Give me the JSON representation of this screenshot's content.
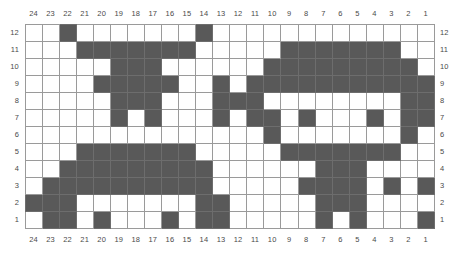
{
  "chart_data": {
    "type": "heatmap",
    "title": "",
    "xlabel": "",
    "ylabel": "",
    "columns": 24,
    "rows": 12,
    "column_labels_top": [
      "24",
      "23",
      "22",
      "21",
      "20",
      "19",
      "18",
      "17",
      "16",
      "15",
      "14",
      "13",
      "12",
      "11",
      "10",
      "9",
      "8",
      "7",
      "6",
      "5",
      "4",
      "3",
      "2",
      "1"
    ],
    "column_labels_bottom": [
      "24",
      "23",
      "22",
      "21",
      "20",
      "19",
      "18",
      "17",
      "16",
      "15",
      "14",
      "13",
      "12",
      "11",
      "10",
      "9",
      "8",
      "7",
      "6",
      "5",
      "4",
      "3",
      "2",
      "1"
    ],
    "row_labels_left": [
      "12",
      "11",
      "10",
      "9",
      "8",
      "7",
      "6",
      "5",
      "4",
      "3",
      "2",
      "1"
    ],
    "row_labels_right": [
      "12",
      "11",
      "10",
      "9",
      "8",
      "7",
      "6",
      "5",
      "4",
      "3",
      "2",
      "1"
    ],
    "legend": [
      {
        "name": "filled-cell",
        "color": "#595959",
        "label": "contrast colour stitch"
      },
      {
        "name": "empty-cell",
        "color": "#ffffff",
        "label": "background colour stitch"
      }
    ],
    "colors": {
      "fill": "#595959",
      "empty": "#ffffff",
      "grid_line": "#9a9a9a",
      "border": "#7b7b7b",
      "label_text": "#4a4a4a",
      "page_background": "#ffffff"
    },
    "grid": [
      {
        "row_label": "12",
        "cells": [
          0,
          0,
          1,
          0,
          0,
          0,
          0,
          0,
          0,
          0,
          1,
          0,
          0,
          0,
          0,
          0,
          0,
          0,
          0,
          0,
          0,
          0,
          0,
          0
        ]
      },
      {
        "row_label": "11",
        "cells": [
          0,
          0,
          0,
          1,
          1,
          1,
          1,
          1,
          1,
          1,
          0,
          0,
          0,
          0,
          0,
          1,
          1,
          1,
          1,
          1,
          1,
          1,
          0,
          0
        ]
      },
      {
        "row_label": "10",
        "cells": [
          0,
          0,
          0,
          0,
          0,
          1,
          1,
          1,
          0,
          0,
          0,
          0,
          0,
          0,
          1,
          1,
          1,
          1,
          1,
          1,
          1,
          1,
          1,
          0
        ]
      },
      {
        "row_label": "9",
        "cells": [
          0,
          0,
          0,
          0,
          1,
          1,
          1,
          1,
          1,
          0,
          0,
          1,
          0,
          1,
          1,
          1,
          1,
          1,
          1,
          1,
          1,
          1,
          1,
          1
        ]
      },
      {
        "row_label": "8",
        "cells": [
          0,
          0,
          0,
          0,
          0,
          1,
          1,
          1,
          0,
          0,
          0,
          1,
          1,
          1,
          0,
          0,
          0,
          0,
          0,
          0,
          0,
          0,
          1,
          1
        ]
      },
      {
        "row_label": "7",
        "cells": [
          0,
          0,
          0,
          0,
          0,
          1,
          0,
          1,
          0,
          0,
          0,
          1,
          0,
          1,
          1,
          0,
          1,
          0,
          0,
          0,
          1,
          0,
          1,
          1
        ]
      },
      {
        "row_label": "6",
        "cells": [
          0,
          0,
          0,
          0,
          0,
          0,
          0,
          0,
          0,
          0,
          0,
          0,
          0,
          0,
          1,
          0,
          0,
          0,
          0,
          0,
          0,
          0,
          1,
          0
        ]
      },
      {
        "row_label": "5",
        "cells": [
          0,
          0,
          0,
          1,
          1,
          1,
          1,
          1,
          1,
          1,
          0,
          0,
          0,
          0,
          0,
          1,
          1,
          1,
          1,
          1,
          1,
          1,
          0,
          0
        ]
      },
      {
        "row_label": "4",
        "cells": [
          0,
          0,
          1,
          1,
          1,
          1,
          1,
          1,
          1,
          1,
          1,
          0,
          0,
          0,
          0,
          0,
          0,
          1,
          1,
          1,
          0,
          0,
          0,
          0
        ]
      },
      {
        "row_label": "3",
        "cells": [
          0,
          1,
          1,
          1,
          1,
          1,
          1,
          1,
          1,
          1,
          1,
          0,
          0,
          0,
          0,
          0,
          1,
          1,
          1,
          1,
          0,
          1,
          0,
          1
        ]
      },
      {
        "row_label": "2",
        "cells": [
          1,
          1,
          1,
          0,
          0,
          0,
          0,
          0,
          0,
          0,
          1,
          1,
          0,
          0,
          0,
          0,
          0,
          1,
          1,
          1,
          0,
          0,
          0,
          0
        ]
      },
      {
        "row_label": "1",
        "cells": [
          0,
          1,
          1,
          0,
          1,
          0,
          0,
          0,
          1,
          0,
          1,
          1,
          0,
          0,
          0,
          0,
          0,
          1,
          0,
          1,
          0,
          0,
          0,
          1
        ]
      }
    ]
  }
}
